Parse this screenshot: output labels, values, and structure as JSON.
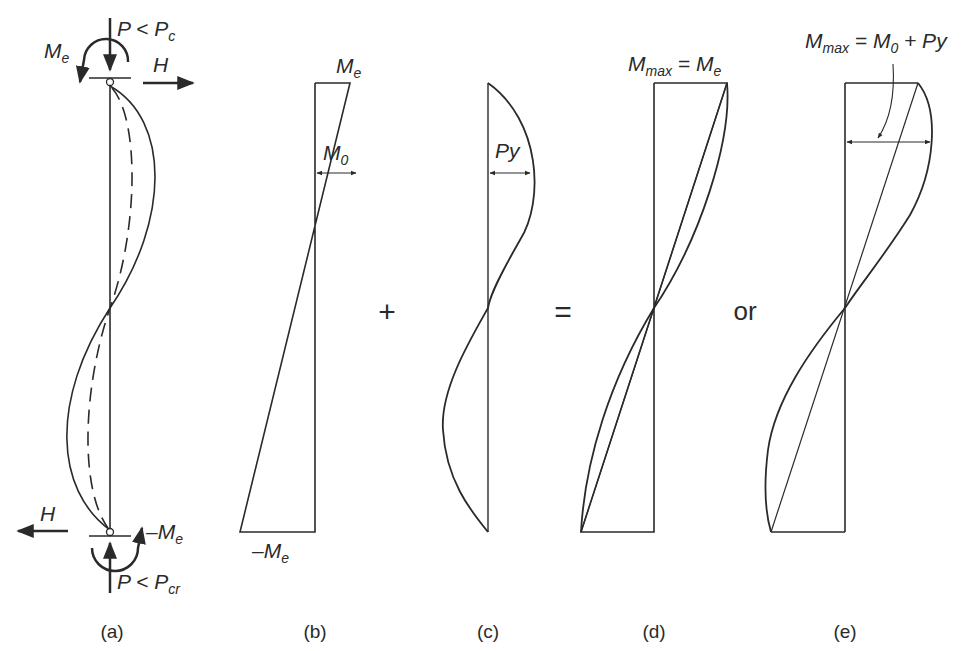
{
  "figure": {
    "panels": [
      {
        "id": "a",
        "caption": "(a)",
        "labels": {
          "top_load": "P < P",
          "top_load_sub": "c",
          "top_moment": "M",
          "top_moment_sub": "e",
          "top_horizontal": "H",
          "bottom_horizontal": "H",
          "bottom_moment": "–M",
          "bottom_moment_sub": "e",
          "bottom_load": "P < P",
          "bottom_load_sub": "cr"
        }
      },
      {
        "id": "b",
        "caption": "(b)",
        "labels": {
          "top": "M",
          "top_sub": "e",
          "mid": "M",
          "mid_sub": "0",
          "bottom": "–M",
          "bottom_sub": "e"
        }
      },
      {
        "id": "c",
        "caption": "(c)",
        "labels": {
          "mid": "Py"
        }
      },
      {
        "id": "d",
        "caption": "(d)",
        "labels": {
          "top": "M",
          "top_sub": "max",
          "top_rest": " = M",
          "top_rest_sub": "e"
        }
      },
      {
        "id": "e",
        "caption": "(e)",
        "labels": {
          "top": "M",
          "top_sub": "max",
          "top_eq": " = M",
          "top_eq_sub": "0",
          "top_rest": " + Py"
        }
      }
    ],
    "operators": {
      "plus": "+",
      "equals": "=",
      "or": "or"
    },
    "colors": {
      "line": "#2a2a2a",
      "background": "#ffffff"
    }
  }
}
